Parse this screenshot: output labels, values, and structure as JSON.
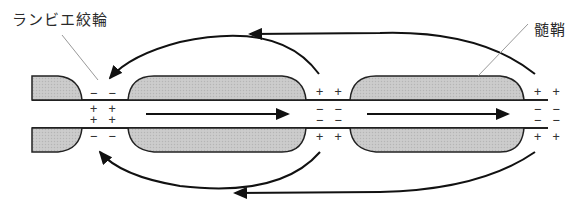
{
  "labels": {
    "node_of_ranvier": "ランビエ絞輪",
    "myelin_sheath": "髄鞘"
  },
  "charges": {
    "node1": {
      "outer_top": "− −",
      "inner_top": "+ +",
      "inner_bottom": "+ +",
      "outer_bottom": "− −"
    },
    "node2": {
      "outer_top": "+ +",
      "inner_top": "− −",
      "inner_bottom": "− −",
      "outer_bottom": "+ +"
    },
    "node3": {
      "outer_top": "+ +",
      "inner_top": "− −",
      "inner_bottom": "− −",
      "outer_bottom": "+ +"
    }
  },
  "colors": {
    "myelin_fill": "#c8c8c8",
    "stroke": "#222222",
    "leader_line": "#999999"
  }
}
